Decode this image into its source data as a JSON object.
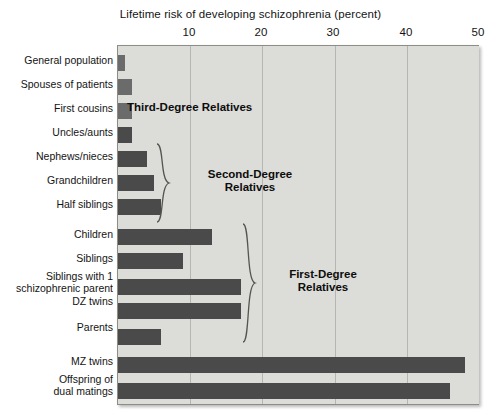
{
  "chart_data": {
    "type": "bar",
    "orientation": "horizontal",
    "title": "Lifetime risk of developing schizophrenia (percent)",
    "xlabel": "Lifetime risk of developing schizophrenia (percent)",
    "ylabel": "",
    "xlim": [
      0,
      50
    ],
    "xticks": [
      10,
      20,
      30,
      40,
      50
    ],
    "xtick_labels": [
      "10",
      "20",
      "30",
      "40",
      "50"
    ],
    "grid": true,
    "legend": "none",
    "categories": [
      "General population",
      "Spouses of patients",
      "First cousins",
      "Uncles/aunts",
      "Nephews/nieces",
      "Grandchildren",
      "Half siblings",
      "Children",
      "Siblings",
      "Siblings with 1\nschizophrenic parent",
      "DZ twins",
      "Parents",
      "MZ twins",
      "Offspring of\ndual matings"
    ],
    "values": [
      1,
      2,
      2,
      2,
      4,
      5,
      6,
      13,
      9,
      17,
      17,
      6,
      48,
      46
    ],
    "bar_shades": [
      "light",
      "light",
      "light",
      "dark",
      "dark",
      "dark",
      "dark",
      "dark",
      "dark",
      "dark",
      "dark",
      "dark",
      "dark",
      "dark"
    ],
    "annotations": [
      {
        "label": "Third-Degree Relatives",
        "group": "third-degree"
      },
      {
        "label": "Second-Degree\nRelatives",
        "group": "second-degree"
      },
      {
        "label": "First-Degree\nRelatives",
        "group": "first-degree"
      }
    ],
    "colors": {
      "plot_background": "#dcdcd8",
      "bar_light": "#6b6b6b",
      "bar_dark": "#4a4a4a",
      "gridline": "#b6b6b0",
      "axis": "#8d8d88",
      "text": "#141414"
    }
  }
}
